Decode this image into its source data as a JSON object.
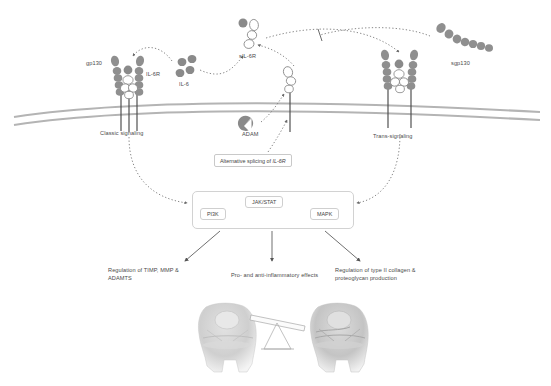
{
  "figure": {
    "background_color": "#ffffff",
    "molecule_color": "#8f8f8f",
    "molecule_outline_color": "#8a8a8a",
    "membrane_color": "#b0b0b0",
    "text_color": "#4a4a4a",
    "box_border_color": "#cdcdcd"
  },
  "molecules": {
    "gp130": "gp130",
    "il6r": "IL-6R",
    "il6": "IL-6",
    "sil6r": "sIL-6R",
    "sgp130": "sgp130",
    "adam": "ADAM"
  },
  "signaling_modes": {
    "classic": "Classic signaling",
    "trans": "Trans-signaling"
  },
  "splicing_box": {
    "prefix": "Alternative splicing of ",
    "gene": "IL-6R"
  },
  "pathways": {
    "left": "PI3K",
    "center": "JAK/STAT",
    "right": "MAPK"
  },
  "outcomes": [
    {
      "id": "outcome-timp",
      "text": "Regulation of TIMP, MMP & ADAMTS"
    },
    {
      "id": "outcome-inflammatory",
      "text": "Pro- and anti-inflammatory effects"
    },
    {
      "id": "outcome-collagen",
      "text": "Regulation of type II collagen & proteoglycan production"
    }
  ],
  "bottom_illustration": {
    "left_joint": "knee-joint-healthy",
    "right_joint": "knee-joint-degenerated",
    "balance": "balance-scale-tilted"
  }
}
